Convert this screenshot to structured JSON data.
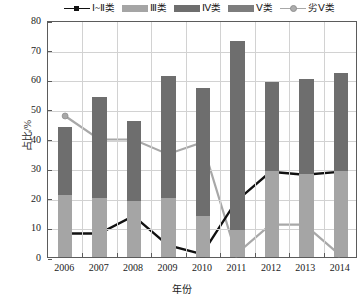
{
  "chart_data": {
    "type": "bar",
    "title": "",
    "xlabel": "年份",
    "ylabel": "占比/%",
    "categories": [
      "2006",
      "2007",
      "2008",
      "2009",
      "2010",
      "2011",
      "2012",
      "2013",
      "2014"
    ],
    "ylim": [
      0,
      80
    ],
    "yticks": [
      0,
      10,
      20,
      30,
      40,
      50,
      60,
      70,
      80
    ],
    "grid": true,
    "legend_position": "top",
    "stacked_bars": true,
    "series": [
      {
        "name": "Ⅰ~Ⅱ类",
        "type": "line",
        "marker": "square",
        "color": "#111111",
        "values": [
          8,
          8,
          14,
          4,
          1,
          19,
          29,
          28,
          29
        ]
      },
      {
        "name": "Ⅲ类",
        "type": "bar",
        "color": "#a5a5a5",
        "values": [
          21,
          20,
          19,
          20,
          14,
          9,
          29,
          28,
          29
        ]
      },
      {
        "name": "Ⅳ类",
        "type": "bar",
        "color": "#6e6e6e",
        "values": [
          23,
          34,
          27,
          41,
          43,
          64,
          30,
          32,
          33
        ]
      },
      {
        "name": "Ⅴ类",
        "type": "bar",
        "color": "#7d7d7d",
        "values": [
          0,
          0,
          0,
          0,
          0,
          0,
          0,
          0,
          0
        ]
      },
      {
        "name": "劣Ⅴ类",
        "type": "line",
        "marker": "circle",
        "color": "#a8a8a8",
        "values": [
          48,
          40,
          40,
          35,
          39,
          1,
          11,
          11,
          1
        ]
      }
    ],
    "bar_totals": [
      44,
      54,
      46,
      61,
      57,
      73,
      59,
      60,
      62
    ]
  },
  "legend": {
    "items": [
      {
        "label": "Ⅰ~Ⅱ类",
        "kind": "line-square",
        "color": "#111111"
      },
      {
        "label": "Ⅲ类",
        "kind": "swatch",
        "color": "#a5a5a5"
      },
      {
        "label": "Ⅳ类",
        "kind": "swatch",
        "color": "#6e6e6e"
      },
      {
        "label": "Ⅴ类",
        "kind": "swatch",
        "color": "#7d7d7d"
      },
      {
        "label": "劣Ⅴ类",
        "kind": "line-circle",
        "color": "#a8a8a8"
      }
    ]
  },
  "axes": {
    "y_title": "占比/%",
    "x_title": "年份",
    "y_tick_labels": [
      "0",
      "10",
      "20",
      "30",
      "40",
      "50",
      "60",
      "70",
      "80"
    ],
    "x_tick_labels": [
      "2006",
      "2007",
      "2008",
      "2009",
      "2010",
      "2011",
      "2012",
      "2013",
      "2014"
    ]
  }
}
